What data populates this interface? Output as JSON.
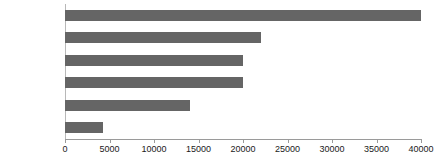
{
  "chart_data": {
    "type": "bar",
    "orientation": "horizontal",
    "title": "",
    "subtitle": "",
    "xlabel": "",
    "ylabel": "",
    "categories": [
      "イネ",
      "マウス",
      "ヒト",
      "カエル",
      "ハエ",
      "大腫菌"
    ],
    "values": [
      40000,
      22000,
      20000,
      20000,
      14000,
      4300
    ],
    "series": [
      {
        "name": "",
        "values": [
          40000,
          22000,
          20000,
          20000,
          14000,
          4300
        ]
      }
    ],
    "xlim": [
      0,
      40000
    ],
    "xticks": [
      0,
      5000,
      10000,
      15000,
      20000,
      25000,
      30000,
      35000,
      40000
    ],
    "xtick_labels": [
      "0",
      "5000",
      "10000",
      "15000",
      "20000",
      "25000",
      "30000",
      "35000",
      "40000"
    ],
    "grid": false,
    "legend": false,
    "legend_position": "none",
    "bar_color": "#656565",
    "axis_color": "#9a9a9a",
    "text_color": "#1a1a1a",
    "background_color": "#ffffff"
  }
}
